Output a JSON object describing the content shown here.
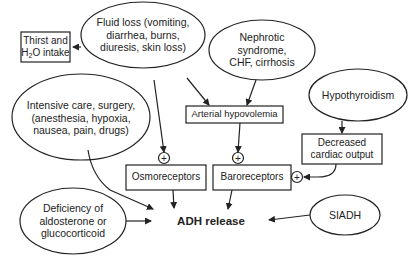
{
  "diagram": {
    "nodes": {
      "thirst": {
        "line1": "Thirst and",
        "line2_pre": "H",
        "line2_sub": "2",
        "line2_post": "O intake",
        "shape": "box"
      },
      "fluid_loss": {
        "line1": "Fluid loss (vomiting,",
        "line2": "diarrhea, burns,",
        "line3": "diuresis, skin loss)",
        "shape": "ellipse"
      },
      "nephrotic": {
        "line1": "Nephrotic",
        "line2": "syndrome,",
        "line3": "CHF, cirrhosis",
        "shape": "ellipse"
      },
      "intensive_care": {
        "line1": "Intensive care, surgery,",
        "line2": "(anesthesia, hypoxia,",
        "line3": "nausea, pain, drugs)",
        "shape": "ellipse"
      },
      "arterial_hypovolemia": {
        "label": "Arterial hypovolemia",
        "shape": "box"
      },
      "hypothyroidism": {
        "label": "Hypothyroidism",
        "shape": "ellipse"
      },
      "decreased_cardiac_output": {
        "line1": "Decreased",
        "line2": "cardiac output",
        "shape": "box"
      },
      "osmoreceptors": {
        "label": "Osmoreceptors",
        "shape": "box"
      },
      "baroreceptors": {
        "label": "Baroreceptors",
        "shape": "box"
      },
      "deficiency": {
        "line1": "Deficiency of",
        "line2": "aldosterone or",
        "line3": "glucocorticoid",
        "shape": "ellipse"
      },
      "adh_release": {
        "label": "ADH release",
        "shape": "text"
      },
      "siadh": {
        "label": "SIADH",
        "shape": "ellipse"
      }
    },
    "plus_symbol": "+",
    "colors": {
      "stroke": "#222222",
      "background": "#ffffff",
      "text": "#222222"
    }
  }
}
